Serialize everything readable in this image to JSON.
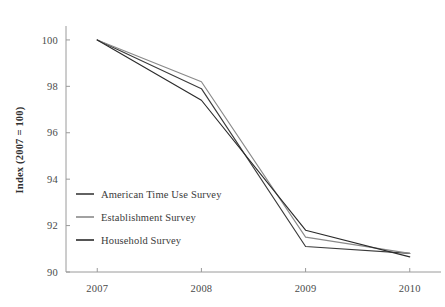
{
  "chart_data": {
    "type": "line",
    "title": "",
    "subtitle": "",
    "xlabel": "",
    "ylabel": "Index (2007 = 100)",
    "x": [
      2007,
      2008,
      2009,
      2010
    ],
    "categories": [
      "2007",
      "2008",
      "2009",
      "2010"
    ],
    "xtick_labels": [
      "2007",
      "2008",
      "2009",
      "2010"
    ],
    "ytick_labels": [
      "90",
      "92",
      "94",
      "96",
      "98",
      "100"
    ],
    "ytick_values": [
      90,
      92,
      94,
      96,
      98,
      100
    ],
    "xlim": [
      2006.7,
      2010.3
    ],
    "ylim": [
      90,
      100.6
    ],
    "grid": false,
    "legend_position": "inside-lower-left",
    "series": [
      {
        "name": "American Time Use Survey",
        "color": "#3b3b3b",
        "values": [
          100,
          97.9,
          91.1,
          90.8
        ]
      },
      {
        "name": "Establishment Survey",
        "color": "#8a8a8a",
        "values": [
          100,
          98.2,
          91.5,
          90.8
        ]
      },
      {
        "name": "Household Survey",
        "color": "#2b2b2b",
        "values": [
          100,
          97.4,
          91.8,
          90.65
        ]
      }
    ]
  },
  "axes": {
    "y_label": "Index (2007 = 100)",
    "y_ticks": [
      "100",
      "98",
      "96",
      "94",
      "92",
      "90"
    ],
    "x_ticks": [
      "2007",
      "2008",
      "2009",
      "2010"
    ]
  },
  "legend": {
    "items": [
      {
        "label": "American Time Use Survey"
      },
      {
        "label": "Establishment Survey"
      },
      {
        "label": "Household Survey"
      }
    ]
  },
  "colors": {
    "background": "#ffffff",
    "axis": "#9a9a9a",
    "text": "#3a3a3a",
    "series_1": "#3b3b3b",
    "series_2": "#8a8a8a",
    "series_3": "#2b2b2b"
  }
}
